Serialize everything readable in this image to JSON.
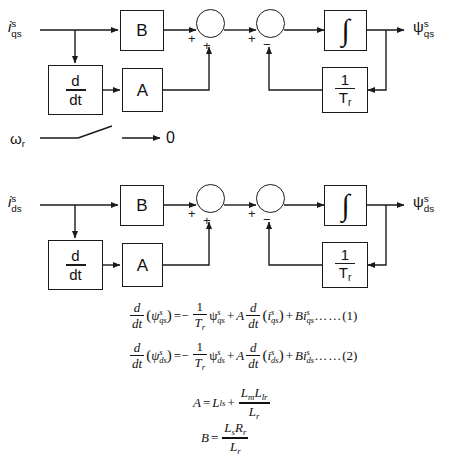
{
  "diagrams": [
    {
      "id": "qs-axis",
      "input_label": {
        "base": "i",
        "sub": "qs",
        "sup": "s"
      },
      "output_label": {
        "base": "ψ",
        "sub": "qs",
        "sup": "s"
      },
      "blocks": [
        {
          "name": "gain-b",
          "label": "B"
        },
        {
          "name": "derivative",
          "numerator": "d",
          "denominator": "dt"
        },
        {
          "name": "gain-a",
          "label": "A"
        },
        {
          "name": "integrator",
          "label": "∫"
        },
        {
          "name": "inverse-tr",
          "numerator": "1",
          "denominator": "T",
          "denominator_sub": "r"
        }
      ],
      "junctions": [
        {
          "name": "sum-1",
          "signs": {
            "left": "+",
            "bottom": "+"
          }
        },
        {
          "name": "sum-2",
          "signs": {
            "left": "+",
            "bottom": "−"
          }
        }
      ]
    },
    {
      "id": "ds-axis",
      "input_label": {
        "base": "i",
        "sub": "ds",
        "sup": "s"
      },
      "output_label": {
        "base": "ψ",
        "sub": "ds",
        "sup": "s"
      },
      "blocks": [
        {
          "name": "gain-b",
          "label": "B"
        },
        {
          "name": "derivative",
          "numerator": "d",
          "denominator": "dt"
        },
        {
          "name": "gain-a",
          "label": "A"
        },
        {
          "name": "integrator",
          "label": "∫"
        },
        {
          "name": "inverse-tr",
          "numerator": "1",
          "denominator": "T",
          "denominator_sub": "r"
        }
      ],
      "junctions": [
        {
          "name": "sum-1",
          "signs": {
            "left": "+",
            "bottom": "+"
          }
        },
        {
          "name": "sum-2",
          "signs": {
            "left": "+",
            "bottom": "−"
          }
        }
      ]
    }
  ],
  "switch_row": {
    "name": "speed-switch",
    "input_label": {
      "base": "ω",
      "sub": "r"
    },
    "output_label": "0",
    "state": "open"
  },
  "equations": [
    {
      "id": "eq1",
      "number": "(1)",
      "dots": "……",
      "lhs": {
        "frac_num": "d",
        "frac_den": "dt",
        "arg_base": "ψ",
        "arg_sub": "qs",
        "arg_sup": "s"
      },
      "rhs_terms": [
        {
          "sign": "=−",
          "frac_num": "1",
          "frac_den": "T",
          "frac_den_sub": "r",
          "var_base": "ψ",
          "var_sub": "qs",
          "var_sup": "s"
        },
        {
          "sign": "+",
          "coeff": "A",
          "frac_num": "d",
          "frac_den": "dt",
          "var_base": "i",
          "var_sub": "qs",
          "var_sup": "s"
        },
        {
          "sign": "+",
          "coeff": "B",
          "var_base": "i",
          "var_sub": "qs",
          "var_sup": "s"
        }
      ],
      "plain": "d/dt(ψqs^s) = −1/Tr ψqs^s + A d/dt(iqs^s) + B iqs^s ……(1)"
    },
    {
      "id": "eq2",
      "number": "(2)",
      "dots": "……",
      "lhs": {
        "frac_num": "d",
        "frac_den": "dt",
        "arg_base": "ψ",
        "arg_sub": "ds",
        "arg_sup": "s"
      },
      "rhs_terms": [
        {
          "sign": "=−",
          "frac_num": "1",
          "frac_den": "T",
          "frac_den_sub": "r",
          "var_base": "ψ",
          "var_sub": "ds",
          "var_sup": "s"
        },
        {
          "sign": "+",
          "coeff": "A",
          "frac_num": "d",
          "frac_den": "dt",
          "var_base": "i",
          "var_sub": "ds",
          "var_sup": "s"
        },
        {
          "sign": "+",
          "coeff": "B",
          "var_base": "i",
          "var_sub": "ds",
          "var_sup": "s"
        }
      ],
      "plain": "d/dt(ψds^s) = −1/Tr ψds^s + A d/dt(ids^s) + B ids^s ……(2)"
    }
  ],
  "definitions": [
    {
      "id": "def-a",
      "symbol": "A",
      "eq": "=",
      "term1_base": "L",
      "term1_sub": "ls",
      "plus": "+",
      "frac_num1_base": "L",
      "frac_num1_sub": "m",
      "frac_num2_base": "L",
      "frac_num2_sub": "lr",
      "frac_den_base": "L",
      "frac_den_sub": "r",
      "plain": "A = Lls + (Lm·Llr)/Lr"
    },
    {
      "id": "def-b",
      "symbol": "B",
      "eq": "=",
      "frac_num1_base": "L",
      "frac_num1_sub": "s",
      "frac_num2_base": "R",
      "frac_num2_sub": "r",
      "frac_den_base": "L",
      "frac_den_sub": "r",
      "plain": "B = (Ls·Rr)/Lr"
    }
  ],
  "colors": {
    "ink": "#1a1a1a",
    "background": "#ffffff"
  }
}
